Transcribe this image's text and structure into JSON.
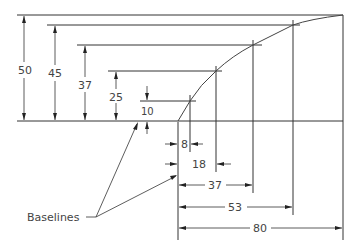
{
  "vertical_dimensions": [
    {
      "label": "50",
      "value": 50
    },
    {
      "label": "45",
      "value": 45
    },
    {
      "label": "37",
      "value": 37
    },
    {
      "label": "25",
      "value": 25
    },
    {
      "label": "10",
      "value": 10
    }
  ],
  "horizontal_dimensions": [
    {
      "label": "8",
      "value": 8
    },
    {
      "label": "18",
      "value": 18
    },
    {
      "label": "37",
      "value": 37
    },
    {
      "label": "53",
      "value": 53
    },
    {
      "label": "80",
      "value": 80
    }
  ],
  "callout": {
    "label": "Baselines"
  },
  "colors": {
    "line": "#333333",
    "text": "#444444",
    "background": "#ffffff"
  }
}
